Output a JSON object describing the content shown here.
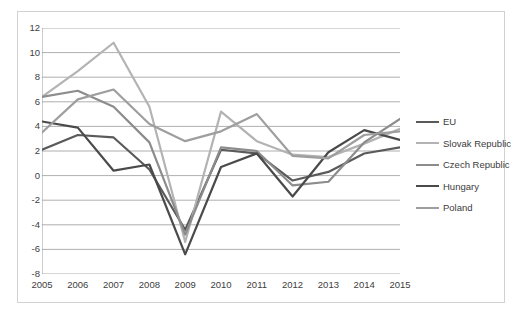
{
  "chart_data": {
    "type": "line",
    "title": "",
    "xlabel": "",
    "ylabel": "",
    "categories": [
      "2005",
      "2006",
      "2007",
      "2008",
      "2009",
      "2010",
      "2011",
      "2012",
      "2013",
      "2014",
      "2015"
    ],
    "ylim": [
      -8,
      12
    ],
    "ytick_step": 2,
    "yticks": [
      "12",
      "10",
      "8",
      "6",
      "4",
      "2",
      "0",
      "-2",
      "-4",
      "-6",
      "-8"
    ],
    "grid": true,
    "legend_position": "right",
    "series": [
      {
        "name": "EU",
        "color": "#5a5a5a",
        "values": [
          2.1,
          3.3,
          3.1,
          0.5,
          -4.4,
          2.1,
          1.8,
          -0.4,
          0.3,
          1.8,
          2.3
        ]
      },
      {
        "name": "Slovak Republic",
        "color": "#b3b3b3",
        "values": [
          6.4,
          8.5,
          10.8,
          5.6,
          -5.4,
          5.2,
          2.8,
          1.7,
          1.5,
          2.6,
          3.8
        ]
      },
      {
        "name": "Czech Republic",
        "color": "#8c8c8c",
        "values": [
          6.4,
          6.9,
          5.6,
          2.7,
          -4.8,
          2.3,
          2.0,
          -0.8,
          -0.5,
          2.7,
          4.6
        ]
      },
      {
        "name": "Hungary",
        "color": "#4a4a4a",
        "values": [
          4.4,
          3.9,
          0.4,
          0.9,
          -6.4,
          0.7,
          1.8,
          -1.7,
          1.9,
          3.7,
          2.9
        ]
      },
      {
        "name": "Poland",
        "color": "#9e9e9e",
        "values": [
          3.5,
          6.2,
          7.0,
          4.2,
          2.8,
          3.6,
          5.0,
          1.6,
          1.4,
          3.3,
          3.6
        ]
      }
    ]
  }
}
